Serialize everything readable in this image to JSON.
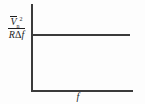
{
  "figure": {
    "background_color": "#fdfdfd",
    "line_color": "#3b3b3b",
    "text_color": "#1d1d1d"
  },
  "axes": {
    "y_axis_name": "y-axis",
    "x_axis_name": "x-axis",
    "y_label": {
      "numerator_symbol": "V",
      "numerator_subscript": "n",
      "numerator_superscript": "2",
      "numerator_overbar": true,
      "numerator_plain": "V̅n²",
      "denominator_plain": "RΔf",
      "denominator_symbol_1": "R",
      "denominator_symbol_2": "Δ",
      "denominator_symbol_3": "f",
      "full_text": "V̅n² / RΔf"
    },
    "x_label": "f"
  },
  "chart_data": {
    "type": "line",
    "title": "",
    "subtitle": "",
    "xlabel": "f",
    "ylabel": "V̅n² / RΔf",
    "x_tick_labels": [],
    "y_tick_labels": [],
    "grid": false,
    "legend": null,
    "legend_position": "none",
    "xlim": [
      0,
      1
    ],
    "ylim": [
      0,
      1
    ],
    "annotations": [],
    "series": [
      {
        "name": "Noise spectral density",
        "x": [
          0.0,
          0.1,
          0.2,
          0.3,
          0.4,
          0.5,
          0.6,
          0.7,
          0.8,
          0.9,
          1.0
        ],
        "values": [
          0.67,
          0.67,
          0.67,
          0.67,
          0.67,
          0.67,
          0.67,
          0.67,
          0.67,
          0.67,
          0.67
        ],
        "style": "solid",
        "color": "#3b3b3b"
      }
    ]
  }
}
